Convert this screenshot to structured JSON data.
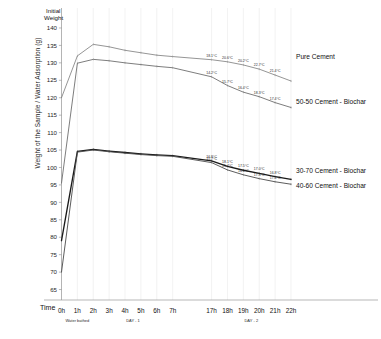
{
  "chart_data": {
    "type": "line",
    "title": "",
    "xlabel": "Time",
    "ylabel": "Weight of the Sample / Water Adsorption (g)",
    "ylim": [
      62,
      142
    ],
    "yticks": [
      65,
      70,
      75,
      80,
      85,
      90,
      95,
      100,
      105,
      110,
      115,
      120,
      125,
      130,
      135,
      140
    ],
    "ytick_labels": [
      "65",
      "70",
      "75",
      "80",
      "85",
      "90",
      "95",
      "100",
      "105",
      "110",
      "115",
      "120",
      "125",
      "130",
      "135",
      "140"
    ],
    "categories": [
      "0h",
      "1h",
      "2h",
      "3h",
      "4h",
      "5h",
      "6h",
      "7h",
      "17h",
      "18h",
      "19h",
      "20h",
      "21h",
      "22h"
    ],
    "grid": true,
    "legend_position": "right",
    "annotations": {
      "initial_weight": "Initial\nWeight",
      "initial_weight_line1": "Initial",
      "initial_weight_line2": "Weight",
      "phase_1": "Water bathed",
      "phase_2": "DAY - 1",
      "phase_3": "DAY - 2"
    },
    "series": [
      {
        "name": "Pure Cement",
        "color": "#7a7a7a",
        "width": 0.8,
        "values": [
          120.0,
          132.0,
          135.3,
          134.6,
          133.6,
          132.9,
          132.2,
          131.8,
          130.9,
          130.3,
          129.4,
          128.2,
          126.5,
          124.8
        ],
        "temps": [
          "18.1°C",
          "20.6°C",
          "20.2°C",
          "22.7°C",
          "21.4°C"
        ]
      },
      {
        "name": "50-50 Cement - Biochar",
        "color": "#6e6e6e",
        "width": 0.9,
        "values": [
          95.5,
          129.9,
          131.0,
          130.6,
          130.0,
          129.5,
          129.0,
          128.6,
          126.0,
          123.5,
          121.6,
          120.3,
          118.6,
          117.2
        ],
        "temps": [
          "14.2°C",
          "15.7°C",
          "16.4°C",
          "18.3°C",
          "17.4°C"
        ]
      },
      {
        "name": "30-70 Cement - Biochar",
        "color": "#1a1a1a",
        "width": 1.35,
        "values": [
          79.0,
          104.6,
          105.2,
          104.7,
          104.3,
          103.9,
          103.6,
          103.4,
          101.9,
          100.3,
          99.2,
          98.3,
          97.4,
          96.6
        ],
        "temps": [
          "16.8°C",
          "18.1°C",
          "17.5°C",
          "17.0°C",
          "16.8°C"
        ]
      },
      {
        "name": "40-60 Cement - Biochar",
        "color": "#4a4a4a",
        "width": 0.9,
        "values": [
          70.0,
          104.4,
          105.0,
          104.5,
          104.1,
          103.7,
          103.4,
          103.2,
          101.4,
          99.3,
          97.9,
          96.8,
          95.9,
          95.2
        ],
        "temps": [
          "15.7°C",
          "15.4°C",
          "16.1°C",
          "17.8°C",
          "17.4°C"
        ]
      }
    ],
    "legend": [
      {
        "label": "Pure Cement"
      },
      {
        "label": "50-50 Cement - Biochar"
      },
      {
        "label": "30-70 Cement - Biochar"
      },
      {
        "label": "40-60 Cement - Biochar"
      }
    ]
  }
}
